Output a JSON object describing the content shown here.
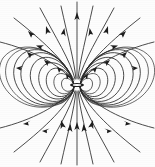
{
  "figure": {
    "kind": "field-line-diagram",
    "background_color": "#fdfdfd",
    "line_color": "#2b2b2b",
    "arrow_color": "#1d1d1d",
    "width": 155,
    "height": 167
  },
  "chart_data": {
    "type": "line",
    "subtitle": "",
    "xlabel": "",
    "ylabel": "",
    "xlim": [
      0,
      155
    ],
    "ylim": [
      0,
      167
    ],
    "grid": false,
    "legend": "none",
    "annotations": [],
    "dipole": {
      "center_x": 77,
      "center_y": 85,
      "axis": "vertical",
      "core_half_length": 7,
      "core_half_width": 2
    },
    "flow_direction": "inward at top, inward-upward at bottom; closed loops circulate about the dipole",
    "closed_loops": {
      "count_per_side": 9,
      "side_radii_x": [
        11,
        17,
        24,
        32,
        41,
        51,
        61,
        70,
        78
      ],
      "side_radii_y": [
        5,
        9,
        14,
        19,
        24,
        28,
        31,
        33,
        34
      ]
    },
    "open_lines": {
      "top_count": 9,
      "bottom_count": 9,
      "top_exit_x": [
        4,
        22,
        44,
        62,
        77,
        92,
        110,
        132,
        151
      ],
      "bottom_exit_x": [
        4,
        22,
        44,
        62,
        77,
        92,
        110,
        132,
        151
      ]
    },
    "arrowheads": {
      "top_count": 9,
      "bottom_count": 9,
      "loop_count": 10,
      "total": 28
    },
    "series": [
      {
        "name": "closed-loop-right-1",
        "rx": 11,
        "ry": 5
      },
      {
        "name": "closed-loop-right-2",
        "rx": 17,
        "ry": 9
      },
      {
        "name": "closed-loop-right-3",
        "rx": 24,
        "ry": 14
      },
      {
        "name": "closed-loop-right-4",
        "rx": 32,
        "ry": 19
      },
      {
        "name": "closed-loop-right-5",
        "rx": 41,
        "ry": 24
      },
      {
        "name": "closed-loop-right-6",
        "rx": 51,
        "ry": 28
      },
      {
        "name": "closed-loop-right-7",
        "rx": 61,
        "ry": 31
      },
      {
        "name": "closed-loop-right-8",
        "rx": 70,
        "ry": 33
      },
      {
        "name": "closed-loop-right-9",
        "rx": 78,
        "ry": 34
      }
    ]
  }
}
